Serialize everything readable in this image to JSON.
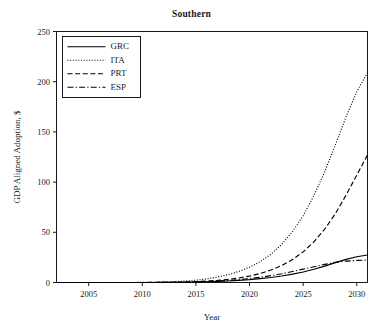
{
  "chart_data": {
    "type": "line",
    "title": "Southern",
    "xlabel": "Year",
    "ylabel": "GDP Aligned Adoption, $",
    "xlim": [
      2002,
      2031
    ],
    "ylim": [
      0,
      250
    ],
    "xticks": [
      2005,
      2010,
      2015,
      2020,
      2025,
      2030
    ],
    "yticks": [
      0,
      50,
      100,
      150,
      200,
      250
    ],
    "grid": false,
    "legend_position": "upper-left",
    "x": [
      2002,
      2003,
      2004,
      2005,
      2006,
      2007,
      2008,
      2009,
      2010,
      2011,
      2012,
      2013,
      2014,
      2015,
      2016,
      2017,
      2018,
      2019,
      2020,
      2021,
      2022,
      2023,
      2024,
      2025,
      2026,
      2027,
      2028,
      2029,
      2030,
      2031
    ],
    "series": [
      {
        "name": "GRC",
        "style": "solid",
        "color": "#000000",
        "values": [
          0,
          0,
          0,
          0,
          0,
          0,
          0,
          0,
          0,
          0,
          0.1,
          0.2,
          0.3,
          0.5,
          0.8,
          1.1,
          1.5,
          2.1,
          2.8,
          3.8,
          5.0,
          6.5,
          8.3,
          10.5,
          13.2,
          16.3,
          19.8,
          23.0,
          25.6,
          27.4
        ]
      },
      {
        "name": "ITA",
        "style": "dotted",
        "color": "#000000",
        "values": [
          0,
          0,
          0,
          0,
          0,
          0,
          0,
          0,
          0.1,
          0.2,
          0.4,
          0.8,
          1.4,
          2.3,
          3.6,
          5.4,
          7.8,
          11.0,
          15.2,
          20.8,
          28.2,
          38.0,
          50.5,
          66.5,
          86.5,
          110.0,
          137.0,
          165.0,
          190.0,
          209.0
        ]
      },
      {
        "name": "PRT",
        "style": "dashed",
        "color": "#000000",
        "values": [
          0,
          0,
          0,
          0,
          0,
          0,
          0,
          0,
          0,
          0.1,
          0.2,
          0.3,
          0.5,
          0.9,
          1.4,
          2.1,
          3.1,
          4.5,
          6.4,
          9.0,
          12.4,
          16.9,
          22.8,
          30.5,
          40.5,
          53.0,
          68.5,
          87.0,
          107.0,
          127.0
        ]
      },
      {
        "name": "ESP",
        "style": "dashdot",
        "color": "#000000",
        "values": [
          0,
          0,
          0,
          0,
          0,
          0,
          0,
          0,
          0,
          0,
          0.1,
          0.2,
          0.4,
          0.7,
          1.0,
          1.5,
          2.1,
          2.9,
          3.9,
          5.2,
          6.8,
          8.7,
          10.9,
          13.3,
          15.7,
          18.0,
          20.0,
          21.3,
          22.0,
          22.3
        ]
      }
    ]
  },
  "legend": {
    "entries": [
      {
        "label": "GRC"
      },
      {
        "label": "ITA"
      },
      {
        "label": "PRT"
      },
      {
        "label": "ESP"
      }
    ]
  },
  "axes": {
    "x_tick_labels": [
      "2005",
      "2010",
      "2015",
      "2020",
      "2025",
      "2030"
    ],
    "y_tick_labels": [
      "0",
      "50",
      "100",
      "150",
      "200",
      "250"
    ]
  }
}
